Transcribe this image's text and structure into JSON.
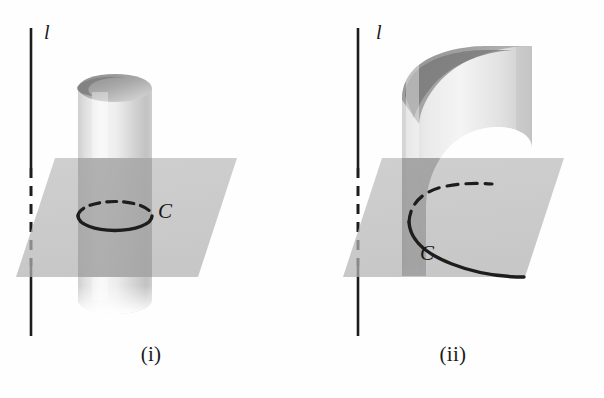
{
  "figure": {
    "background_color": "#fefefe",
    "panels": [
      {
        "id": "i",
        "caption": "(i)",
        "surface_type": "circular-cylinder",
        "axis_label": "l",
        "curve_label": "C",
        "curve_type": "ellipse",
        "description": "A vertical circular cylinder cut by a horizontal plane; the intersection curve C is a closed ellipse (circle seen in perspective). The vertical line l lies to the left of the cylinder and is drawn dashed where it passes behind the translucent plane."
      },
      {
        "id": "ii",
        "caption": "(ii)",
        "surface_type": "parabolic-cylinder",
        "axis_label": "l",
        "curve_label": "C",
        "curve_type": "parabola",
        "description": "A vertical parabolic (open, curved) cylinder cut by a horizontal plane; the intersection curve C is an open parabola with its vertex at the left. The vertical line l lies to the left and is dashed where it passes behind the translucent plane."
      }
    ],
    "colors": {
      "stroke": "#1d1d1d",
      "plane_fill": "#b9b9b9",
      "surface_light": "#f2f2f2",
      "surface_mid": "#d0d0d0",
      "surface_dark": "#8e8e8e",
      "surface_shadow": "#6f6f6f",
      "background": "#fefefe"
    },
    "stroke_widths": {
      "axis_line": 2.6,
      "curve_solid": 3.2,
      "curve_dashed": 3.2
    }
  }
}
